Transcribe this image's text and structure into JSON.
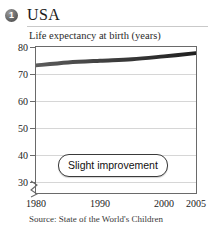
{
  "card": {
    "badge_number": "1",
    "title": "USA"
  },
  "chart_data": {
    "type": "line",
    "title": "Life expectancy at birth (years)",
    "xlabel": "",
    "ylabel": "Life expectancy at birth (years)",
    "xlim": [
      1980,
      2005
    ],
    "ylim": [
      30,
      80
    ],
    "y_axis_broken": true,
    "grid": true,
    "legend": "none",
    "ytick_labels": [
      "80",
      "70",
      "60",
      "50",
      "40",
      "30"
    ],
    "ytick_values": [
      80,
      70,
      60,
      50,
      40,
      30
    ],
    "xtick_labels": [
      "1980",
      "1990",
      "2000",
      "2005"
    ],
    "xtick_values": [
      1980,
      1990,
      2000,
      2005
    ],
    "series": [
      {
        "name": "Life expectancy",
        "x": [
          1980,
          1985,
          1990,
          1995,
          2000,
          2005
        ],
        "values": [
          73.7,
          74.7,
          75.3,
          75.8,
          76.8,
          77.9
        ]
      }
    ],
    "annotations": [
      {
        "text": "Slight improvement"
      }
    ],
    "source": "Source: State of the World's Children",
    "line_color": "#4a4a4a"
  }
}
